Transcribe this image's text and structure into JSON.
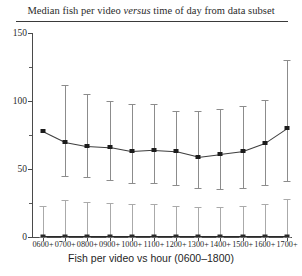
{
  "chart_data": {
    "type": "line",
    "title": "Median fish per video versus time of day from data subset",
    "title_prefix": "Median fish per video ",
    "title_italic": "versus",
    "title_suffix": " time of day from data subset",
    "xlabel": "Fish per video vs hour (0600–1800)",
    "ylabel": "",
    "ylim": [
      0,
      150
    ],
    "yticks": [
      0,
      50,
      100,
      150
    ],
    "ytick_labels": [
      "0",
      "50",
      "100",
      "150"
    ],
    "yticks_minor": [
      25,
      75,
      125
    ],
    "grid": false,
    "legend": "none",
    "categories": [
      "0600+",
      "0700+",
      "0800+",
      "0900+",
      "1000+",
      "1100+",
      "1200+",
      "1300+",
      "1400+",
      "1500+",
      "1600+",
      "1700+"
    ],
    "series": [
      {
        "name": "median-fish-per-video",
        "values": [
          78,
          70,
          67,
          66,
          63,
          64,
          63,
          59,
          61,
          63,
          69,
          80
        ],
        "error_upper": [
          78,
          112,
          105,
          100,
          98,
          98,
          93,
          93,
          94,
          96,
          101,
          130
        ],
        "error_lower": [
          78,
          45,
          44,
          42,
          40,
          40,
          38,
          36,
          35,
          36,
          38,
          41
        ],
        "marker": "square",
        "line_color": "#3d3d3d",
        "errorbar_color": "#8c8c8c"
      },
      {
        "name": "baseline-near-zero",
        "values": [
          1,
          1,
          1,
          1,
          1,
          1,
          1,
          1,
          1,
          1,
          1,
          1
        ],
        "error_upper": [
          23,
          27,
          26,
          25,
          24,
          24,
          23,
          22,
          22,
          23,
          24,
          28
        ],
        "error_lower": [
          0,
          0,
          0,
          0,
          0,
          0,
          0,
          0,
          0,
          0,
          0,
          0
        ],
        "marker": "square",
        "line_color": "#2a2a2a",
        "errorbar_color": "#aaaaaa"
      }
    ]
  }
}
